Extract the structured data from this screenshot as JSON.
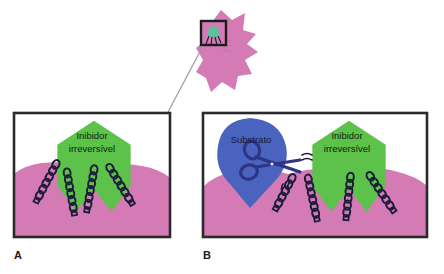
{
  "figure": {
    "type": "diagram",
    "language": "pt-BR",
    "background_color": "#ffffff"
  },
  "enzyme": {
    "label": "E",
    "label_color": "#c07aac",
    "body_color": "#d47ab4",
    "inset_box": {
      "border_color": "#1b1b1b",
      "inner_color": "#d47ab4",
      "mini_inhibitor_color": "#5fbf9e"
    },
    "connector_line_color": "#9a9a9a"
  },
  "panels": [
    {
      "id": "A",
      "label": "A",
      "border_color": "#2a2a2a",
      "fill_color": "#ffffff",
      "enzyme_surface_color": "#d47ab4",
      "inhibitor": {
        "name": "inibidor",
        "line1": "Inibidor",
        "line2": "irreversível",
        "color": "#5cc24a",
        "text_color": "#11220f",
        "shape": "pentagon-with-notch"
      },
      "chains": {
        "count": 4,
        "color": "#1c1c3a",
        "description": "cadeias-laterais-em-elo"
      },
      "substrate": null,
      "scissors": null
    },
    {
      "id": "B",
      "label": "B",
      "border_color": "#2a2a2a",
      "fill_color": "#ffffff",
      "enzyme_surface_color": "#d47ab4",
      "inhibitor": {
        "name": "inibidor",
        "line1": "Inibidor",
        "line2": "irreversível",
        "color": "#5cc24a",
        "text_color": "#11220f",
        "shape": "pentagon-with-notch"
      },
      "chains": {
        "count": 4,
        "color": "#1c1c3a",
        "description": "cadeias-laterais-em-elo"
      },
      "substrate": {
        "label": "Substrato",
        "color": "#4a63be",
        "text_color": "#15163a",
        "shape": "teardrop"
      },
      "scissors": {
        "color": "#2e3486",
        "description": "tesoura-clivagem"
      },
      "motion_marks": {
        "color": "#1c1c3a",
        "count": 2
      }
    }
  ]
}
